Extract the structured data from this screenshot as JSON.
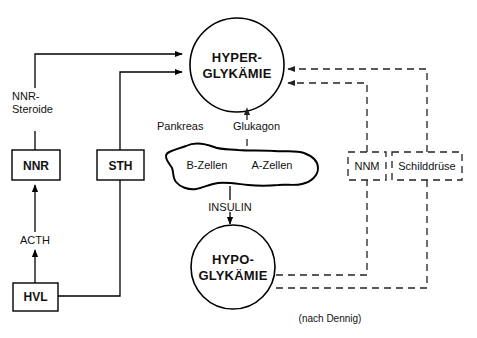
{
  "diagram": {
    "caption": "(nach Dennig)",
    "nodes": {
      "hyperglykaemie_line1": "HYPER-",
      "hyperglykaemie_line2": "GLYKÄMIE",
      "hypoglykaemie_line1": "HYPO-",
      "hypoglykaemie_line2": "GLYKÄMIE",
      "nnr_steroide_line1": "NNR-",
      "nnr_steroide_line2": "Steroide",
      "nnr": "NNR",
      "sth": "STH",
      "hvl": "HVL",
      "acth": "ACTH",
      "pankreas": "Pankreas",
      "glukagon": "Glukagon",
      "b_zellen": "B-Zellen",
      "a_zellen": "A-Zellen",
      "insulin": "INSULIN",
      "nnm": "NNM",
      "schilddruese": "Schilddrüse"
    },
    "colors": {
      "stroke": "#000000",
      "dashed_stroke": "#222222",
      "background": "#ffffff",
      "text": "#111111"
    }
  }
}
